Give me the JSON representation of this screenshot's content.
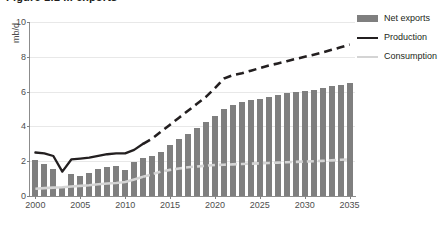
{
  "figure": {
    "title": "Figure 1.1 ... exports",
    "y_axis_unit": "mb/d"
  },
  "legend": {
    "position": "top-right",
    "items": [
      {
        "label": "Net exports",
        "icon": "bar-swatch",
        "color": "#7f7f7f"
      },
      {
        "label": "Production",
        "icon": "solid-line-swatch",
        "color": "#231f20"
      },
      {
        "label": "Consumption",
        "icon": "light-line-swatch",
        "color": "#d4d4d4"
      }
    ]
  },
  "chart_data": {
    "type": "bar",
    "title": "Figure 1.1 ... exports",
    "xlabel": "",
    "ylabel": "mb/d",
    "ylim": [
      0,
      10
    ],
    "xlim": [
      1999.4,
      2035.6
    ],
    "yticks": [
      0,
      2,
      4,
      6,
      8,
      10
    ],
    "xticks": [
      2000,
      2005,
      2010,
      2015,
      2020,
      2025,
      2030,
      2035
    ],
    "grid": true,
    "legend_position": "top-right",
    "forecast_starts": 2012,
    "x": [
      2000,
      2001,
      2002,
      2003,
      2004,
      2005,
      2006,
      2007,
      2008,
      2009,
      2010,
      2011,
      2012,
      2013,
      2014,
      2015,
      2016,
      2017,
      2018,
      2019,
      2020,
      2021,
      2022,
      2023,
      2024,
      2025,
      2026,
      2027,
      2028,
      2029,
      2030,
      2031,
      2032,
      2033,
      2034,
      2035
    ],
    "series": [
      {
        "name": "Net exports",
        "type": "bar",
        "color": "#7f7f7f",
        "values": [
          2.05,
          1.85,
          1.55,
          0.45,
          1.25,
          1.15,
          1.35,
          1.55,
          1.65,
          1.7,
          1.5,
          1.95,
          2.2,
          2.3,
          2.55,
          2.95,
          3.25,
          3.55,
          3.9,
          4.25,
          4.6,
          5.0,
          5.25,
          5.4,
          5.5,
          5.6,
          5.7,
          5.8,
          5.9,
          5.95,
          6.05,
          6.1,
          6.2,
          6.3,
          6.4,
          6.5
        ]
      },
      {
        "name": "Production",
        "type": "line",
        "color": "#231f20",
        "style": "solid-then-dashed",
        "values": [
          2.5,
          2.45,
          2.3,
          1.4,
          2.1,
          2.15,
          2.2,
          2.3,
          2.4,
          2.45,
          2.45,
          2.65,
          3.0,
          3.3,
          3.7,
          4.1,
          4.5,
          4.9,
          5.3,
          5.7,
          6.2,
          6.75,
          6.95,
          7.05,
          7.2,
          7.35,
          7.5,
          7.62,
          7.75,
          7.88,
          8.0,
          8.12,
          8.25,
          8.4,
          8.55,
          8.7
        ]
      },
      {
        "name": "Consumption",
        "type": "line",
        "color": "#d4d4d4",
        "style": "solid-then-dashed",
        "values": [
          0.42,
          0.45,
          0.48,
          0.5,
          0.55,
          0.58,
          0.62,
          0.68,
          0.72,
          0.75,
          0.8,
          0.95,
          1.1,
          1.25,
          1.4,
          1.5,
          1.58,
          1.65,
          1.7,
          1.74,
          1.78,
          1.8,
          1.82,
          1.84,
          1.86,
          1.88,
          1.9,
          1.92,
          1.94,
          1.96,
          1.98,
          2.0,
          2.02,
          2.05,
          2.08,
          2.1
        ]
      }
    ]
  }
}
